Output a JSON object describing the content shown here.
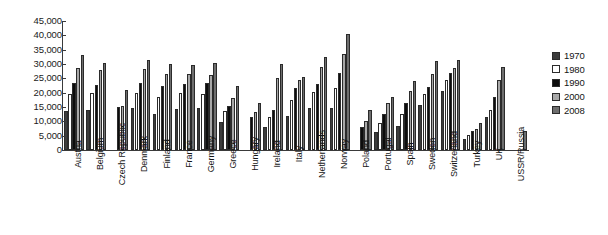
{
  "chart_data": {
    "type": "bar",
    "title": "",
    "subtitle": "",
    "xlabel": "",
    "ylabel": "",
    "ylim": [
      0,
      45000
    ],
    "ytick_step": 5000,
    "grid": false,
    "legend_position": "right",
    "ytick_labels": [
      "45,000",
      "40,000",
      "35,000",
      "30,000",
      "25,000",
      "20,000",
      "15,000",
      "10,000",
      "5,000",
      "0"
    ],
    "ytick_values": [
      45000,
      40000,
      35000,
      30000,
      25000,
      20000,
      15000,
      10000,
      5000,
      0
    ],
    "categories": [
      "Austria",
      "Belgium",
      "Czech Republic",
      "Denmark",
      "Finland",
      "France",
      "Germany",
      "Greece",
      "Hungary",
      "Ireland",
      "Italy",
      "Netherlands",
      "Norway",
      "Poland",
      "Portugal",
      "Spain",
      "Sweden",
      "Switzerland",
      "Turkey",
      "UK",
      "USSR/Russia"
    ],
    "series": [
      {
        "name": "1970",
        "color": "#3c3c3c",
        "values": [
          13500,
          14000,
          null,
          14700,
          12500,
          14200,
          14500,
          9700,
          null,
          8000,
          11800,
          14500,
          14500,
          null,
          6200,
          8300,
          15700,
          20500,
          3800,
          11400,
          null
        ]
      },
      {
        "name": "1980",
        "color": "#ffffff",
        "values": [
          19500,
          20000,
          null,
          19800,
          18500,
          19800,
          19500,
          13500,
          null,
          11500,
          17500,
          20300,
          21500,
          null,
          9300,
          12500,
          19700,
          24300,
          5200,
          14000,
          null
        ]
      },
      {
        "name": "1990",
        "color": "#0d0d0d",
        "values": [
          23500,
          22800,
          15000,
          23500,
          22500,
          23000,
          23500,
          15500,
          11600,
          14000,
          21500,
          23000,
          26800,
          8000,
          12500,
          16500,
          22000,
          27000,
          6500,
          18500,
          null
        ]
      },
      {
        "name": "2000",
        "color": "#a8a8a8",
        "values": [
          28500,
          27800,
          15500,
          28200,
          26500,
          26500,
          26000,
          18000,
          13200,
          25000,
          24500,
          28800,
          33500,
          10000,
          16500,
          20500,
          26500,
          28500,
          7200,
          24500,
          null
        ]
      },
      {
        "name": "2008",
        "color": "#6e6e6e",
        "values": [
          33000,
          30500,
          21000,
          31500,
          30000,
          29500,
          30500,
          22500,
          16500,
          30000,
          25500,
          32500,
          40500,
          14000,
          18500,
          24000,
          31000,
          31500,
          9500,
          29000,
          6500
        ]
      }
    ]
  },
  "legend": {
    "items": [
      {
        "label": "1970",
        "color": "#3c3c3c"
      },
      {
        "label": "1980",
        "color": "#ffffff"
      },
      {
        "label": "1990",
        "color": "#0d0d0d"
      },
      {
        "label": "2000",
        "color": "#a8a8a8"
      },
      {
        "label": "2008",
        "color": "#6e6e6e"
      }
    ]
  }
}
